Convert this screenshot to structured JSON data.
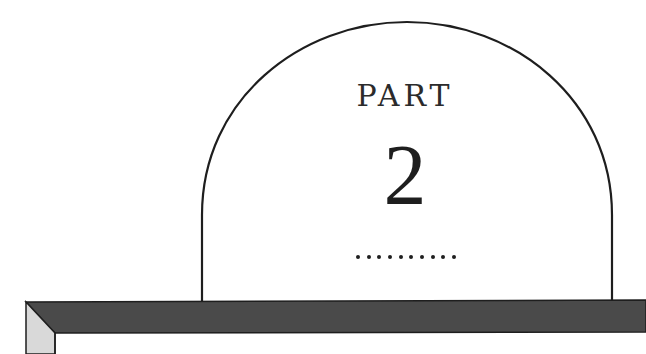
{
  "chapter_opener": {
    "label": "PART",
    "number": "2",
    "ornament": {
      "type": "dotted-rule",
      "dot_count": 10
    }
  },
  "colors": {
    "background": "#ffffff",
    "ink": "#1e1e1e",
    "frame_top": "#4a4a4a",
    "frame_bevel": "#d9d9d9"
  }
}
